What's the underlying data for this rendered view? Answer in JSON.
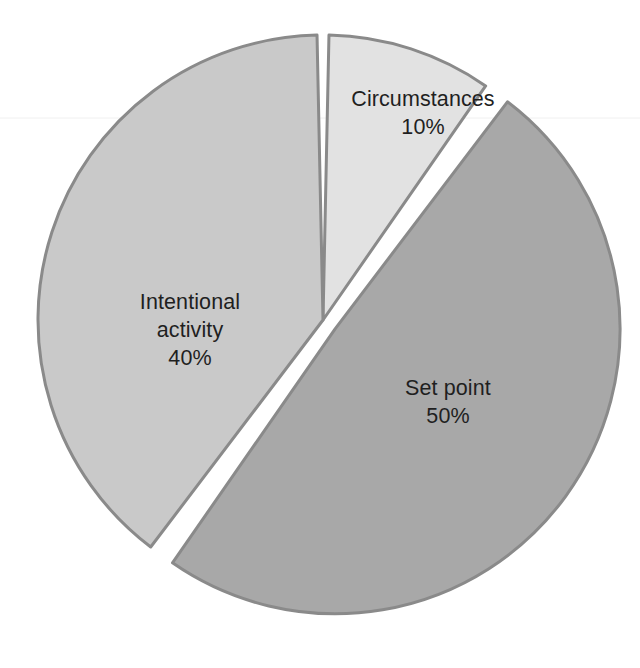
{
  "figure": {
    "background_color": "#ffffff",
    "width": 640,
    "height": 668
  },
  "chart_data": {
    "type": "pie",
    "title": "",
    "subtitle": "",
    "xlabel": "",
    "ylabel": "",
    "legend_position": "none",
    "grid": false,
    "units": "percent",
    "total": 100,
    "start_angle_deg": 0,
    "direction": "clockwise",
    "categories": [
      "Circumstances",
      "Set point",
      "Intentional activity"
    ],
    "values": [
      10,
      50,
      40
    ],
    "labels_inside": true,
    "slices": [
      {
        "name": "Circumstances",
        "label": "Circumstances",
        "value": 10,
        "value_label": "10%",
        "color": "#e2e2e2",
        "edge_color": "#8a8a8a",
        "exploded": false,
        "start_deg": 0,
        "end_deg": 36
      },
      {
        "name": "Set point",
        "label": "Set point",
        "value": 50,
        "value_label": "50%",
        "color": "#a8a8a8",
        "edge_color": "#8a8a8a",
        "exploded": true,
        "start_deg": 36,
        "end_deg": 216
      },
      {
        "name": "Intentional activity",
        "label_line1": "Intentional",
        "label_line2": "activity",
        "label": "Intentional activity",
        "value": 40,
        "value_label": "40%",
        "color": "#c9c9c9",
        "edge_color": "#8a8a8a",
        "exploded": false,
        "start_deg": 216,
        "end_deg": 360
      }
    ]
  }
}
